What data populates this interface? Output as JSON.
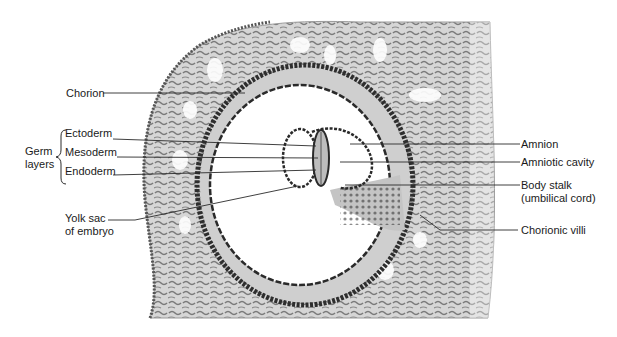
{
  "figure": {
    "type": "anatomical-illustration"
  },
  "labels_left": {
    "chorion": "Chorion",
    "germ_layers": "Germ\nlayers",
    "ectoderm": "Ectoderm",
    "mesoderm": "Mesoderm",
    "endoderm": "Endoderm",
    "yolk_sac": "Yolk sac\nof embryo"
  },
  "labels_right": {
    "amnion": "Amnion",
    "amniotic_cavity": "Amniotic cavity",
    "body_stalk": "Body stalk\n(umbilical cord)",
    "chorionic_villi": "Chorionic villi"
  },
  "colors": {
    "tissue_fill": "#d4d4d4",
    "tissue_dark": "#3a3a3a",
    "line": "#2a2a2a",
    "background": "#ffffff"
  }
}
